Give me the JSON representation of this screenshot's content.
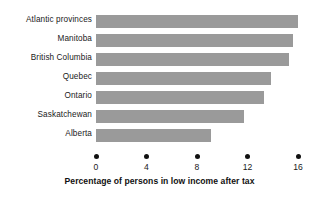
{
  "chart_data": {
    "type": "bar",
    "orientation": "horizontal",
    "title": "",
    "subtitle": "",
    "xlabel": "Percentage of persons in low income after tax",
    "ylabel": "",
    "categories": [
      "Atlantic provinces",
      "Manitoba",
      "British Columbia",
      "Quebec",
      "Ontario",
      "Saskatchewan",
      "Alberta"
    ],
    "values": [
      16.0,
      15.6,
      15.3,
      13.9,
      13.3,
      11.7,
      9.1
    ],
    "xlim": [
      0,
      16
    ],
    "xticks": [
      0,
      4,
      8,
      12,
      16
    ],
    "xtick_labels": [
      "0",
      "4",
      "8",
      "12",
      "16"
    ],
    "grid": false,
    "legend": false,
    "legend_position": "none",
    "bar_color": "#9a9a9a",
    "axis_color": "#111111",
    "text_color": "#1a1a1a",
    "background_color": "#ffffff"
  }
}
